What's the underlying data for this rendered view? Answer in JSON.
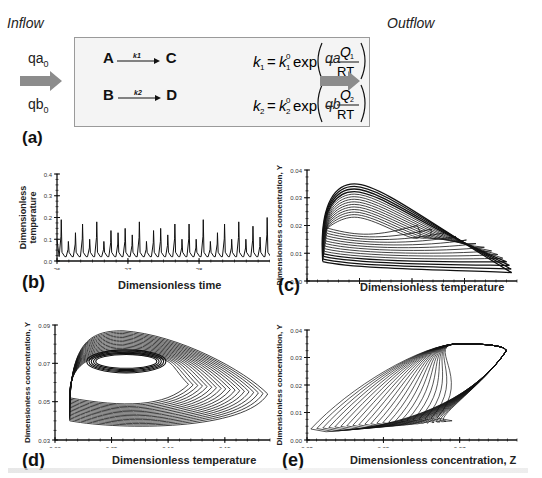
{
  "figure": {
    "inflow_title": "Inflow",
    "outflow_title": "Outflow",
    "inflow_a": "qa",
    "inflow_a_sub": "0",
    "inflow_b": "qb",
    "inflow_b_sub": "0",
    "outflow_a": "qa",
    "outflow_b": "qb",
    "reaction1": {
      "reactant": "A",
      "product": "C",
      "rate": "k1"
    },
    "reaction2": {
      "reactant": "B",
      "product": "D",
      "rate": "k2"
    },
    "equation1": "k1 = k1^0 exp(-Q1/RT)",
    "equation2": "k2 = k2^0 exp(-Q2/RT)",
    "arrow_color": "#8c8c8c",
    "box_border_color": "#9a9a9a"
  },
  "panel_labels": {
    "a": "(a)",
    "b": "(b)",
    "c": "(c)",
    "d": "(d)",
    "e": "(e)"
  },
  "chart_data": [
    {
      "panel": "b",
      "type": "line",
      "title": "",
      "xlabel": "Dimensionless time",
      "ylabel": "Dimensionless temperature",
      "xlim": [
        26,
        29
      ],
      "ylim": [
        0.0,
        0.4
      ],
      "xticks": [
        "26",
        "27",
        "28"
      ],
      "yticks": [
        "0.0",
        "0.1",
        "0.2",
        "0.3",
        "0.4"
      ],
      "peaks_x": [
        26.06,
        26.16,
        26.26,
        26.36,
        26.46,
        26.56,
        26.66,
        26.76,
        26.86,
        26.96,
        27.06,
        27.16,
        27.26,
        27.36,
        27.46,
        27.56,
        27.66,
        27.76,
        27.86,
        27.96,
        28.06,
        28.16,
        28.26,
        28.36,
        28.46,
        28.56,
        28.66,
        28.76,
        28.86,
        28.96
      ],
      "peaks_y": [
        0.19,
        0.09,
        0.13,
        0.17,
        0.1,
        0.18,
        0.09,
        0.14,
        0.13,
        0.15,
        0.12,
        0.18,
        0.09,
        0.14,
        0.15,
        0.12,
        0.17,
        0.1,
        0.17,
        0.1,
        0.19,
        0.09,
        0.13,
        0.17,
        0.1,
        0.18,
        0.1,
        0.16,
        0.11,
        0.2
      ],
      "baseline": 0.02,
      "grid": false
    },
    {
      "panel": "c",
      "type": "line",
      "title": "",
      "xlabel": "Dimensionless temperature",
      "ylabel": "Dimensionless concentration, Y",
      "xlim": [
        0.0,
        0.2
      ],
      "ylim": [
        0.0,
        0.04
      ],
      "xticks": [
        "0.00",
        "0.05",
        "0.10",
        "0.15"
      ],
      "yticks": [
        "0.00",
        "0.01",
        "0.02",
        "0.03",
        "0.04"
      ],
      "description": "Chaotic attractor: nested loops from (0.015,0.005) rising to peak ~(0.04,0.035), descending to tip ~(0.195,0.003)",
      "grid": false
    },
    {
      "panel": "d",
      "type": "line",
      "title": "",
      "xlabel": "Dimensionless temperature",
      "ylabel": "Dimensionless concentration, Y",
      "xlim": [
        0.0,
        0.19
      ],
      "ylim": [
        0.03,
        0.08
      ],
      "xticks": [
        "0.00",
        "0.05",
        "0.10",
        "0.15"
      ],
      "yticks": [
        "0.03",
        "0.05",
        "0.07",
        "0.09"
      ],
      "description": "Chaotic attractor with inner ellipse near (0.06,0.07); outer bounds x 0.012–0.19, y 0.035–0.088",
      "grid": false
    },
    {
      "panel": "e",
      "type": "line",
      "title": "",
      "xlabel": "Dimensionless concentration, Z",
      "ylabel": "Dimensionless concentration, Y",
      "xlim": [
        0.03,
        0.085
      ],
      "ylim": [
        0.0,
        0.04
      ],
      "xticks": [
        "0.03",
        "0.05",
        "0.07"
      ],
      "yticks": [
        "0.00",
        "0.01",
        "0.02",
        "0.03",
        "0.04"
      ],
      "description": "Elongated diagonal attractor from (0.031,0.004) to (0.082,0.034)",
      "grid": false
    }
  ]
}
